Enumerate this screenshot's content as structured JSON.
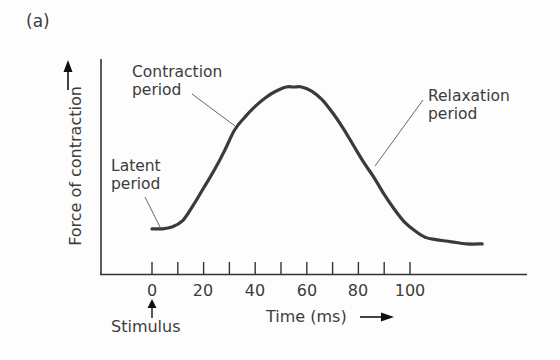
{
  "figure": {
    "panel_label": "(a)",
    "ylabel": "Force of contraction",
    "xlabel": "Time (ms)",
    "stimulus_label": "Stimulus",
    "annotations": {
      "latent": [
        "Latent",
        "period"
      ],
      "contraction": [
        "Contraction",
        "period"
      ],
      "relaxation": [
        "Relaxation",
        "period"
      ]
    },
    "x_ticks": [
      "0",
      "20",
      "40",
      "60",
      "80",
      "100"
    ]
  },
  "chart_data": {
    "type": "line",
    "title": "(a)",
    "xlabel": "Time (ms)",
    "ylabel": "Force of contraction",
    "xlim": [
      -19,
      145
    ],
    "ylim": [
      0,
      100
    ],
    "x_tick_labels": [
      "0",
      "20",
      "40",
      "60",
      "80",
      "100"
    ],
    "minor_ticks_every": 10,
    "grid": false,
    "legend": null,
    "series": [
      {
        "name": "Muscle twitch",
        "x": [
          0,
          4,
          8,
          12,
          16,
          20,
          24,
          28,
          32,
          36,
          40,
          44,
          48,
          52,
          55,
          58,
          62,
          66,
          70,
          74,
          78,
          82,
          86,
          90,
          94,
          98,
          102,
          106,
          110,
          116,
          122,
          128
        ],
        "y": [
          21,
          21,
          22,
          25,
          32,
          40,
          48,
          57,
          67,
          73,
          78,
          82,
          85,
          87,
          87,
          87,
          85,
          81,
          75,
          68,
          60,
          52,
          45,
          37,
          30,
          24,
          20,
          17,
          16,
          15,
          14,
          14
        ]
      }
    ],
    "annotations": [
      {
        "text": "Stimulus",
        "x": 0,
        "arrow": "up"
      },
      {
        "text": "Latent period",
        "x": 0,
        "y": 21
      },
      {
        "text": "Contraction period",
        "x": 32,
        "y": 67
      },
      {
        "text": "Relaxation period",
        "x": 86,
        "y": 45
      }
    ]
  }
}
